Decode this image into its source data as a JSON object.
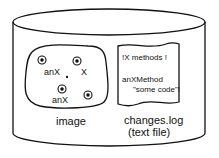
{
  "diagram": {
    "container": "cylinder",
    "image_blob": {
      "label": "image",
      "objects": [
        {
          "label": "anX",
          "x": 42,
          "y": 60
        },
        {
          "label": "X",
          "x": 77,
          "y": 61
        },
        {
          "label": "anX",
          "x": 62,
          "y": 89
        },
        {
          "label": "",
          "x": 88,
          "y": 95
        }
      ]
    },
    "changes_log": {
      "lines": [
        "!X methods !",
        "anXMethod",
        "\"some code\"!"
      ],
      "label_line1": "changes.log",
      "label_line2": "(text file)"
    }
  }
}
